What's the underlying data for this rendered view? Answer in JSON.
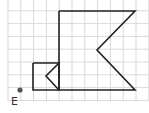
{
  "figure": {
    "grid": {
      "x0": 8,
      "y0": -2,
      "spacing": 12.8,
      "cols": 11,
      "rows": 8,
      "line_color": "#d9d9d9"
    },
    "shapes": {
      "big_shape": {
        "points": [
          [
            59,
            11
          ],
          [
            135,
            11
          ],
          [
            97,
            50
          ],
          [
            135,
            90
          ],
          [
            59,
            90
          ]
        ],
        "stroke": "#222222"
      },
      "small_square": {
        "points": [
          [
            33,
            63
          ],
          [
            59,
            63
          ],
          [
            59,
            90
          ],
          [
            33,
            90
          ]
        ],
        "stroke": "#222222"
      },
      "notch": {
        "points": [
          [
            59,
            63
          ],
          [
            46,
            76
          ],
          [
            59,
            90
          ]
        ],
        "stroke": "#222222"
      }
    },
    "point": {
      "label": "E",
      "x": 20,
      "y": 90,
      "color": "#555555"
    }
  }
}
